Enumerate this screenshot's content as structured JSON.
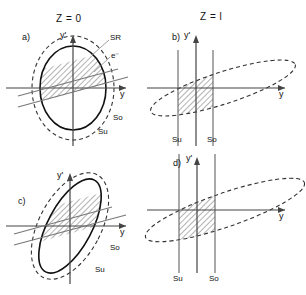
{
  "figure": {
    "titles": {
      "left": "Z = 0",
      "right": "Z = l"
    },
    "axis_labels": {
      "vertical": "y'",
      "horizontal": "y"
    },
    "curve_labels": {
      "sr": "SR",
      "electron": "e⁻",
      "so": "So",
      "su": "Su"
    }
  },
  "panels": [
    {
      "id": "a",
      "label": "a)",
      "column": "left",
      "title": "Z = 0",
      "shows_sr_label": true,
      "shows_e_label": true,
      "so_label": "So",
      "su_label": "Su",
      "axis_v": "y'",
      "axis_h": "y"
    },
    {
      "id": "b",
      "label": "b)",
      "column": "right",
      "title": "Z = l",
      "shows_sr_label": false,
      "shows_e_label": false,
      "so_label": "So",
      "su_label": "Su",
      "axis_v": "y'",
      "axis_h": "y"
    },
    {
      "id": "c",
      "label": "c)",
      "column": "left",
      "title": "Z = 0",
      "shows_sr_label": false,
      "shows_e_label": false,
      "so_label": "So",
      "su_label": "Su",
      "axis_v": "y'",
      "axis_h": "y"
    },
    {
      "id": "d",
      "label": "d)",
      "column": "right",
      "title": "Z = l",
      "shows_sr_label": false,
      "shows_e_label": false,
      "so_label": "So",
      "su_label": "Su",
      "axis_v": "y'",
      "axis_h": "y"
    }
  ],
  "colors": {
    "ink": "#111111",
    "axis": "#444444",
    "dashed": "#333333",
    "hatch": "#555555",
    "background": "#ffffff"
  }
}
